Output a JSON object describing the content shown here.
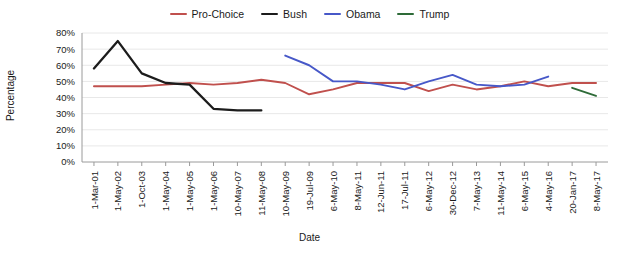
{
  "legend": {
    "position": "top-center",
    "entries": [
      {
        "label": "Pro-Choice",
        "color": "#C0504D"
      },
      {
        "label": "Bush",
        "color": "#1C1C1C"
      },
      {
        "label": "Obama",
        "color": "#4758C8"
      },
      {
        "label": "Trump",
        "color": "#2E6B38"
      }
    ]
  },
  "chart_data": {
    "type": "line",
    "title": "",
    "xlabel": "Date",
    "ylabel": "Percentage",
    "ylim": [
      0,
      80
    ],
    "yticks": [
      0,
      10,
      20,
      30,
      40,
      50,
      60,
      70,
      80
    ],
    "ytick_labels": [
      "0%",
      "10%",
      "20%",
      "30%",
      "40%",
      "50%",
      "60%",
      "70%",
      "80%"
    ],
    "grid": true,
    "grid_axis": "y",
    "categories": [
      "1-Mar-01",
      "1-May-02",
      "1-Oct-03",
      "1-May-04",
      "1-May-05",
      "1-May-06",
      "10-May-07",
      "11-May-08",
      "10-May-09",
      "19-Jul-09",
      "6-May-10",
      "8-May-11",
      "12-Jun-11",
      "17-Jul-11",
      "6-May-12",
      "30-Dec-12",
      "7-May-13",
      "11-May-14",
      "6-May-15",
      "4-May-16",
      "20-Jan-17",
      "8-May-17"
    ],
    "series": [
      {
        "name": "Pro-Choice",
        "color": "#C0504D",
        "values": [
          47,
          47,
          47,
          48,
          49,
          48,
          49,
          51,
          49,
          42,
          45,
          49,
          49,
          49,
          44,
          48,
          45,
          47,
          50,
          47,
          49,
          49
        ]
      },
      {
        "name": "Bush",
        "color": "#1C1C1C",
        "values": [
          58,
          75,
          55,
          49,
          48,
          33,
          32,
          32,
          null,
          null,
          null,
          null,
          null,
          null,
          null,
          null,
          null,
          null,
          null,
          null,
          null,
          null
        ]
      },
      {
        "name": "Obama",
        "color": "#4758C8",
        "values": [
          null,
          null,
          null,
          null,
          null,
          null,
          null,
          null,
          66,
          60,
          50,
          50,
          48,
          45,
          50,
          54,
          48,
          47,
          48,
          53,
          null,
          null
        ]
      },
      {
        "name": "Trump",
        "color": "#2E6B38",
        "values": [
          null,
          null,
          null,
          null,
          null,
          null,
          null,
          null,
          null,
          null,
          null,
          null,
          null,
          null,
          null,
          null,
          null,
          null,
          null,
          null,
          46,
          41
        ]
      }
    ]
  },
  "axis": {
    "x_title": "Date",
    "y_title": "Percentage"
  }
}
